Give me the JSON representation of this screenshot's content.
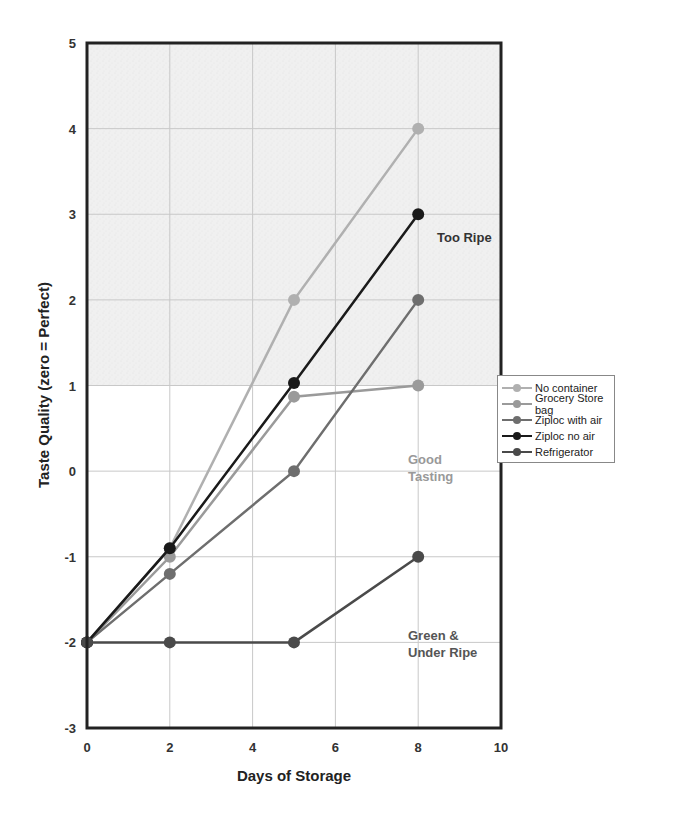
{
  "chart_data": {
    "type": "line",
    "title": "",
    "xlabel": "Days of Storage",
    "ylabel": "Taste Quality (zero = Perfect)",
    "xlim": [
      0,
      10
    ],
    "ylim": [
      -3,
      5
    ],
    "xticks": [
      "0",
      "2",
      "4",
      "6",
      "8",
      "10"
    ],
    "yticks": [
      "5",
      "4",
      "3",
      "2",
      "1",
      "0",
      "-1",
      "-2",
      "-3"
    ],
    "grid": true,
    "legend_position": "right",
    "shaded_region": {
      "from": 1,
      "to": 5,
      "label": "Too Ripe"
    },
    "annotations": [
      {
        "text": "Too Ripe",
        "x": 8.4,
        "y": 2.7
      },
      {
        "text": "Good",
        "x": 7.8,
        "y": 0.1
      },
      {
        "text": "Tasting",
        "x": 7.8,
        "y": -0.08
      },
      {
        "text": "Green &",
        "x": 7.8,
        "y": -1.9
      },
      {
        "text": "Under Ripe",
        "x": 7.8,
        "y": -2.1
      }
    ],
    "x": [
      0,
      2,
      5,
      8
    ],
    "series": [
      {
        "name": "No container",
        "color": "#b0b0b0",
        "values": [
          -2,
          -0.9,
          2,
          4
        ]
      },
      {
        "name": "Grocery Store bag",
        "color": "#9a9a9a",
        "values": [
          -2,
          -1,
          0.87,
          1
        ]
      },
      {
        "name": "Ziploc with air",
        "color": "#6e6e6e",
        "values": [
          -2,
          -1.2,
          0,
          2
        ]
      },
      {
        "name": "Ziploc no air",
        "color": "#1a1a1a",
        "values": [
          -2,
          -0.9,
          1.03,
          3
        ]
      },
      {
        "name": "Refrigerator",
        "color": "#4a4a4a",
        "values": [
          -2,
          -2,
          -2,
          -1
        ]
      }
    ]
  },
  "legend": {
    "items": [
      {
        "label": "No container",
        "color": "#b0b0b0"
      },
      {
        "label": "Grocery Store bag",
        "color": "#9a9a9a"
      },
      {
        "label": "Ziploc with air",
        "color": "#6e6e6e"
      },
      {
        "label": "Ziploc no air",
        "color": "#1a1a1a"
      },
      {
        "label": "Refrigerator",
        "color": "#4a4a4a"
      }
    ]
  },
  "labels": {
    "xlabel": "Days of Storage",
    "ylabel": "Taste Quality (zero = Perfect)",
    "too_ripe": "Too Ripe",
    "good_1": "Good",
    "good_2": "Tasting",
    "green_1": "Green &",
    "green_2": "Under Ripe"
  }
}
